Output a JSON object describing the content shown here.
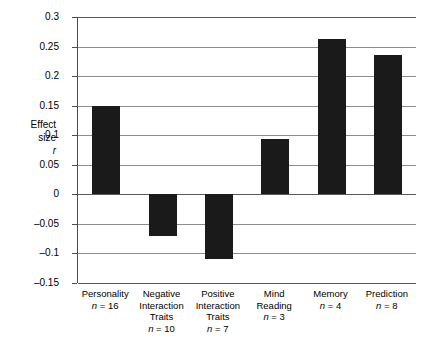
{
  "chart_data": {
    "type": "bar",
    "title": "",
    "xlabel": "",
    "ylabel": "Effect size r",
    "ylim": [
      -0.15,
      0.3
    ],
    "ytick_step": 0.05,
    "grid": true,
    "legend": null,
    "categories": [
      "Personality",
      "Negative Interaction Traits",
      "Positive Interaction Traits",
      "Mind Reading",
      "Memory",
      "Prediction"
    ],
    "values": [
      0.15,
      -0.071,
      -0.11,
      0.093,
      0.262,
      0.236
    ],
    "sample_sizes": [
      16,
      10,
      7,
      3,
      4,
      8
    ],
    "ytick_labels": [
      "0.3",
      "0.25",
      "0.2",
      "0.15",
      "0.1",
      "0.05",
      "0",
      "-0.05",
      "-0.1",
      "-0.15"
    ],
    "ytick_values": [
      0.3,
      0.25,
      0.2,
      0.15,
      0.1,
      0.05,
      0,
      -0.05,
      -0.1,
      -0.15
    ],
    "bar_color": "#1a1a1a",
    "grid_color": "#8c8c8c",
    "axis_color": "#4d4d4d"
  },
  "axis_title": {
    "line1": "Effect",
    "line2": "size",
    "line3": "r"
  },
  "categories_display": [
    {
      "name_lines": [
        "Personality"
      ],
      "n_label": "n = 16"
    },
    {
      "name_lines": [
        "Negative",
        "Interaction",
        "Traits"
      ],
      "n_label": "n = 10"
    },
    {
      "name_lines": [
        "Positive",
        "Interaction",
        "Traits"
      ],
      "n_label": "n = 7"
    },
    {
      "name_lines": [
        "Mind",
        "Reading"
      ],
      "n_label": "n = 3"
    },
    {
      "name_lines": [
        "Memory"
      ],
      "n_label": "n = 4"
    },
    {
      "name_lines": [
        "Prediction"
      ],
      "n_label": "n = 8"
    }
  ]
}
